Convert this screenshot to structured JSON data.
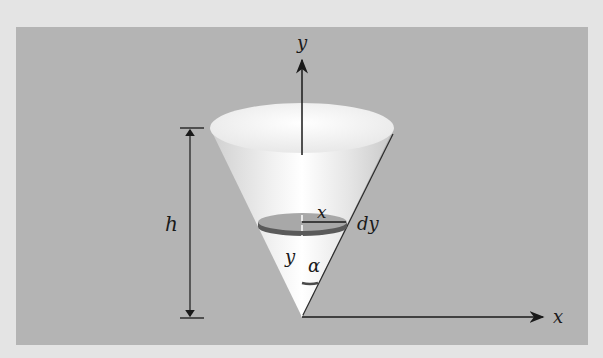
{
  "diagram": {
    "labels": {
      "y_axis": "y",
      "x_axis": "x",
      "height": "h",
      "disk_radius": "x",
      "disk_thickness": "dy",
      "disk_height": "y",
      "half_angle": "α"
    },
    "colors": {
      "outer_background": "#e4e4e4",
      "panel": "#b4b4b4",
      "lines": "#1a1a1a",
      "cone_light": "#ffffff",
      "disk_top": "#a8a8a8",
      "disk_edge": "#5a5a5a"
    }
  }
}
